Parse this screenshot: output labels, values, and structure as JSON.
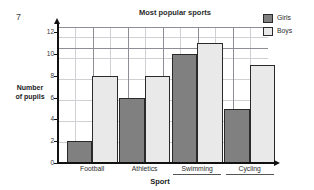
{
  "question_number": "7",
  "axis": {
    "y_title_line1": "Number",
    "y_title_line2": "of pupils",
    "x_title": "Sport",
    "y_ticks": [
      "0",
      "2",
      "4",
      "6",
      "8",
      "10",
      "12"
    ]
  },
  "legend": {
    "items": [
      {
        "label": "Girls",
        "color": "#808080"
      },
      {
        "label": "Boys",
        "color": "#e9e9e9"
      }
    ]
  },
  "chart_data": {
    "type": "bar",
    "title": "Most popular sports",
    "xlabel": "Sport",
    "ylabel": "Number of pupils",
    "categories": [
      "Football",
      "Athletics",
      "Swimming",
      "Cycling"
    ],
    "series": [
      {
        "name": "Girls",
        "color": "#808080",
        "values": [
          2,
          6,
          10,
          5
        ]
      },
      {
        "name": "Boys",
        "color": "#e9e9e9",
        "values": [
          8,
          8,
          11,
          9
        ]
      }
    ],
    "ylim": [
      0,
      12.5
    ],
    "y_major_step": 2,
    "y_minor_step": 1,
    "grid": true,
    "legend_position": "top-right",
    "annotations": [
      {
        "text": "Swimming",
        "type": "underline"
      },
      {
        "text": "Cycling",
        "type": "underline"
      }
    ]
  }
}
